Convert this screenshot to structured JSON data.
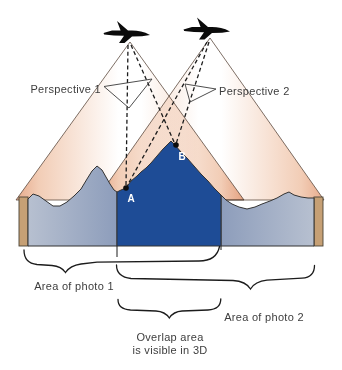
{
  "diagram": {
    "perspective1_label": "Perspective 1",
    "perspective2_label": "Perspective 2",
    "point_a_label": "A",
    "point_b_label": "B",
    "area_photo1_label": "Area of photo 1",
    "area_photo2_label": "Area of photo 2",
    "overlap_label_line1": "Overlap area",
    "overlap_label_line2": "is visible in 3D",
    "colors": {
      "cone_edge": "#e7ab8c",
      "cone_mid": "#f2cdb6",
      "cone_center": "#ffffff",
      "photo_terrain_light": "#b7c0d0",
      "photo_terrain_dark": "#8d9dbb",
      "overlap_terrain": "#1e4c96",
      "ground_strip": "#c6a075",
      "airplane": "#0b0b0b",
      "label_text": "#3d3d3d",
      "point_label_text": "#ffffff",
      "background": "#ffffff"
    }
  }
}
